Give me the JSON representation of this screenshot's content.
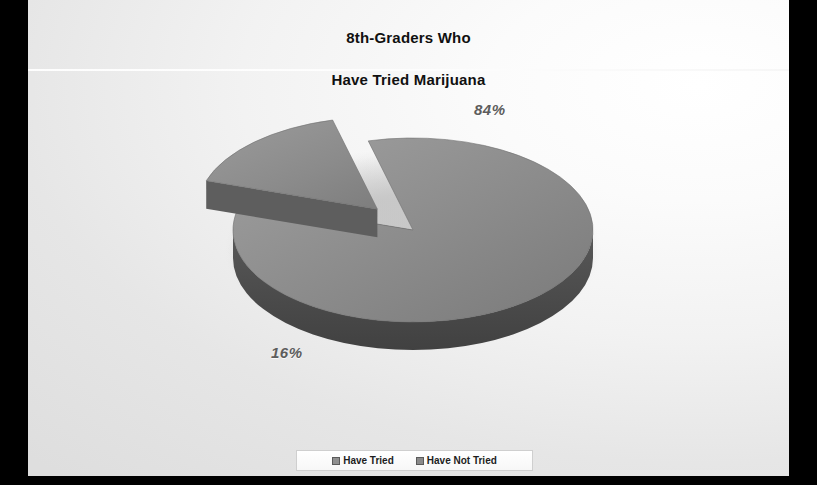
{
  "slide": {
    "title_line1": "8th-Graders Who",
    "title_line2": "Have Tried Marijuana"
  },
  "labels": {
    "tried": "16%",
    "not_tried": "84%"
  },
  "legend": {
    "items": [
      {
        "label": "Have Tried",
        "color": "#8f8f8f"
      },
      {
        "label": "Have Not Tried",
        "color": "#8a8a8a"
      }
    ]
  },
  "colors": {
    "pie_top_light": "#949494",
    "pie_top_dark": "#7e7e7e",
    "pie_side": "#4c4c4c",
    "background_light": "#ffffff",
    "background_dark": "#dedede",
    "frame": "#000000",
    "title_text": "#101010",
    "value_text": "#5d5d5d"
  },
  "chart_data": {
    "type": "pie",
    "title": "8th-Graders Who Have Tried Marijuana",
    "categories": [
      "Have Tried",
      "Have Not Tried"
    ],
    "values": [
      16,
      84
    ],
    "unit": "%",
    "data_labels": [
      "16%",
      "84%"
    ],
    "exploded_slice": "Have Tried",
    "three_d": true,
    "legend_position": "bottom",
    "grid": false,
    "start_angle_deg": 198,
    "direction": "clockwise"
  }
}
